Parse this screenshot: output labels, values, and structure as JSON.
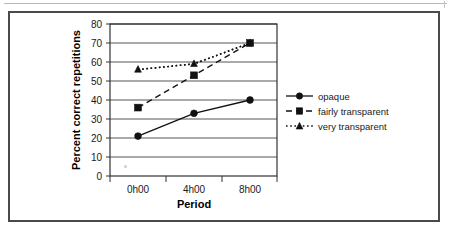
{
  "figure": {
    "background_color": "#ffffff",
    "frame_color": "#4a4a4a"
  },
  "chart_data": {
    "type": "line",
    "title": "",
    "xlabel": "Period",
    "ylabel": "Percent correct repetitions",
    "categories": [
      "0h00",
      "4h00",
      "8h00"
    ],
    "ylim": [
      0,
      80
    ],
    "ytick_step": 10,
    "yticks": [
      "0",
      "10",
      "20",
      "30",
      "40",
      "50",
      "60",
      "70",
      "80"
    ],
    "grid": "horizontal",
    "legend_position": "right",
    "series": [
      {
        "name": "opaque",
        "values": [
          21,
          33,
          40
        ],
        "line_style": "solid",
        "marker": "circle",
        "color": "#111111"
      },
      {
        "name": "fairly transparent",
        "values": [
          36,
          53,
          70
        ],
        "line_style": "dashed",
        "marker": "square",
        "color": "#111111"
      },
      {
        "name": "very transparent",
        "values": [
          56,
          59,
          70
        ],
        "line_style": "dotted",
        "marker": "triangle",
        "color": "#111111"
      }
    ]
  },
  "legend": {
    "items": [
      {
        "label": "opaque",
        "marker": "circle-marker-icon",
        "line_style": "solid"
      },
      {
        "label": "fairly transparent",
        "marker": "square-marker-icon",
        "line_style": "dashed"
      },
      {
        "label": "very transparent",
        "marker": "triangle-marker-icon",
        "line_style": "dotted"
      }
    ]
  }
}
